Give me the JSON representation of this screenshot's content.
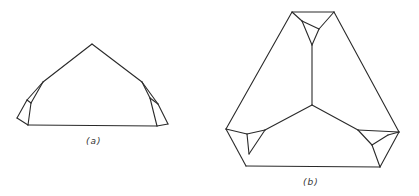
{
  "figures": [
    {
      "id": "a",
      "label": "(a)",
      "label_pos": [
        86,
        136
      ],
      "edges": [
        [
          [
            43,
            82
          ],
          [
            92,
            44
          ]
        ],
        [
          [
            92,
            44
          ],
          [
            142,
            82
          ]
        ],
        [
          [
            28,
            125
          ],
          [
            157,
            126
          ]
        ],
        [
          [
            43,
            82
          ],
          [
            27,
            100
          ]
        ],
        [
          [
            27,
            100
          ],
          [
            17,
            118
          ]
        ],
        [
          [
            17,
            118
          ],
          [
            28,
            125
          ]
        ],
        [
          [
            43,
            82
          ],
          [
            31,
            103
          ]
        ],
        [
          [
            31,
            103
          ],
          [
            28,
            125
          ]
        ],
        [
          [
            27,
            100
          ],
          [
            31,
            103
          ]
        ],
        [
          [
            142,
            82
          ],
          [
            150,
            98
          ]
        ],
        [
          [
            150,
            98
          ],
          [
            157,
            126
          ]
        ],
        [
          [
            142,
            82
          ],
          [
            158,
            104
          ]
        ],
        [
          [
            158,
            104
          ],
          [
            168,
            124
          ]
        ],
        [
          [
            168,
            124
          ],
          [
            157,
            126
          ]
        ],
        [
          [
            150,
            98
          ],
          [
            158,
            104
          ]
        ]
      ]
    },
    {
      "id": "b",
      "label": "(b)",
      "label_pos": [
        303,
        177
      ],
      "edges": [
        [
          [
            292,
            12
          ],
          [
            334,
            12
          ]
        ],
        [
          [
            292,
            12
          ],
          [
            226,
            129
          ]
        ],
        [
          [
            334,
            12
          ],
          [
            399,
            132
          ]
        ],
        [
          [
            246,
            166
          ],
          [
            380,
            167
          ]
        ],
        [
          [
            292,
            12
          ],
          [
            302,
            21
          ]
        ],
        [
          [
            302,
            21
          ],
          [
            319,
            29
          ]
        ],
        [
          [
            334,
            12
          ],
          [
            319,
            29
          ]
        ],
        [
          [
            302,
            21
          ],
          [
            312,
            45
          ]
        ],
        [
          [
            319,
            29
          ],
          [
            312,
            45
          ]
        ],
        [
          [
            312,
            45
          ],
          [
            312,
            105
          ]
        ],
        [
          [
            312,
            105
          ],
          [
            265,
            130
          ]
        ],
        [
          [
            312,
            105
          ],
          [
            358,
            130
          ]
        ],
        [
          [
            226,
            129
          ],
          [
            246,
            166
          ]
        ],
        [
          [
            226,
            129
          ],
          [
            247,
            134
          ]
        ],
        [
          [
            247,
            134
          ],
          [
            265,
            130
          ]
        ],
        [
          [
            247,
            134
          ],
          [
            249,
            154
          ]
        ],
        [
          [
            265,
            130
          ],
          [
            249,
            154
          ]
        ],
        [
          [
            358,
            130
          ],
          [
            399,
            132
          ]
        ],
        [
          [
            358,
            130
          ],
          [
            372,
            145
          ]
        ],
        [
          [
            372,
            145
          ],
          [
            388,
            135
          ]
        ],
        [
          [
            388,
            135
          ],
          [
            399,
            132
          ]
        ],
        [
          [
            372,
            145
          ],
          [
            380,
            167
          ]
        ],
        [
          [
            399,
            132
          ],
          [
            380,
            167
          ]
        ]
      ]
    }
  ],
  "colors": {
    "stroke": "#2a2a2a",
    "background": "#ffffff"
  }
}
